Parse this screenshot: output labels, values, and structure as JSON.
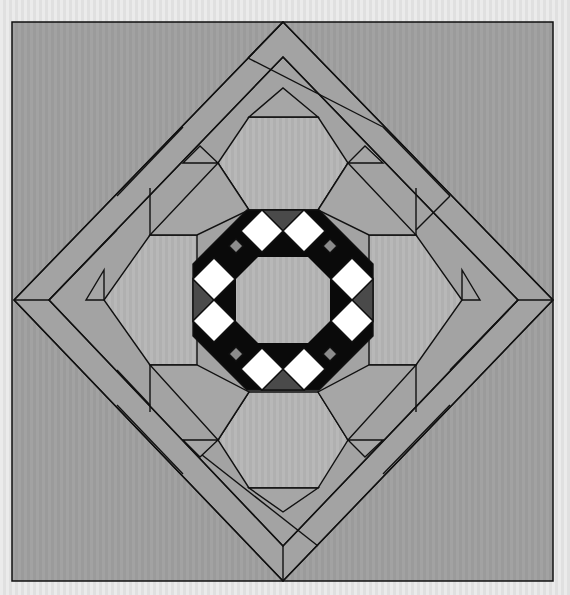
{
  "diagram": {
    "type": "quilt-block-layout",
    "colors": {
      "page_background": "#e4e4e4",
      "background_fabric": "#9a9a9a",
      "medium_fabric": "#a6a6a6",
      "light_fabric": "#b4b4b4",
      "strip_fabric": "#9e9e9e",
      "center_fabric": "#b8b8b8",
      "dark_fabric": "#4a4a4a",
      "black_fabric": "#0a0a0a",
      "white_fabric": "#ffffff",
      "stripe_gray": "#8c8c8c",
      "outline": "#111111"
    },
    "frame": {
      "x": 12,
      "y": 22,
      "width": 541,
      "height": 559
    },
    "center": {
      "x": 283,
      "y": 300
    },
    "components": [
      {
        "name": "outer-background",
        "label": "Background square"
      },
      {
        "name": "outer-diamond",
        "label": "On-point outer diamond"
      },
      {
        "name": "border-strips",
        "label": "Diagonal border strips (8)"
      },
      {
        "name": "light-hexagons",
        "label": "Light hexagon blocks (4)"
      },
      {
        "name": "medium-corners",
        "label": "Medium triangle corners"
      },
      {
        "name": "center-octagon",
        "label": "Center octagon"
      },
      {
        "name": "ring-white-squares",
        "label": "White squares in ring (8)"
      },
      {
        "name": "ring-black-strips",
        "label": "Black/gray striped bars (4)"
      },
      {
        "name": "dark-triangles",
        "label": "Dark triangles (4)"
      }
    ]
  }
}
